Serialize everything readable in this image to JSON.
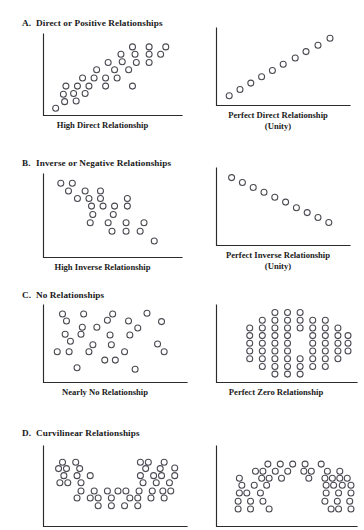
{
  "figure": {
    "title_present": false,
    "marker_style": "open-circle",
    "marker_color": "#4a4a52",
    "axis_color": "#2b2b2b",
    "background": "#ffffff"
  },
  "sections": [
    {
      "letter": "A.",
      "heading": "Direct or Positive Relationships",
      "left_caption": "High Direct Relationship",
      "left_caption_line2": "",
      "right_caption": "Perfect Direct Relationship",
      "right_caption_line2": "(Unity)"
    },
    {
      "letter": "B.",
      "heading": "Inverse or Negative Relationships",
      "left_caption": "High Inverse Relationship",
      "left_caption_line2": "",
      "right_caption": "Perfect Inverse Relationship",
      "right_caption_line2": "(Unity)"
    },
    {
      "letter": "C.",
      "heading": "No Relationships",
      "left_caption": "Nearly No Relationship",
      "left_caption_line2": "",
      "right_caption": "Perfect Zero Relationship",
      "right_caption_line2": ""
    },
    {
      "letter": "D.",
      "heading": "Curvilinear Relationships",
      "left_caption": "",
      "left_caption_line2": "",
      "right_caption": "",
      "right_caption_line2": ""
    }
  ],
  "chart_data": [
    {
      "id": "a-left",
      "type": "scatter",
      "title": "High Direct Relationship",
      "xlabel": "",
      "ylabel": "",
      "xlim": [
        0,
        100
      ],
      "ylim": [
        0,
        100
      ],
      "grid": false,
      "legend": "none",
      "points": [
        [
          6,
          5
        ],
        [
          13,
          14
        ],
        [
          22,
          15
        ],
        [
          12,
          24
        ],
        [
          20,
          25
        ],
        [
          29,
          25
        ],
        [
          14,
          35
        ],
        [
          23,
          35
        ],
        [
          32,
          35
        ],
        [
          45,
          35
        ],
        [
          66,
          35
        ],
        [
          27,
          46
        ],
        [
          36,
          46
        ],
        [
          45,
          46
        ],
        [
          54,
          46
        ],
        [
          38,
          57
        ],
        [
          52,
          57
        ],
        [
          63,
          57
        ],
        [
          47,
          67
        ],
        [
          58,
          68
        ],
        [
          69,
          67
        ],
        [
          79,
          67
        ],
        [
          57,
          78
        ],
        [
          68,
          78
        ],
        [
          79,
          78
        ],
        [
          88,
          78
        ],
        [
          66,
          88
        ],
        [
          79,
          88
        ],
        [
          92,
          88
        ]
      ]
    },
    {
      "id": "a-right",
      "type": "scatter",
      "title": "Perfect Direct Relationship (Unity)",
      "xlabel": "",
      "ylabel": "",
      "xlim": [
        0,
        100
      ],
      "ylim": [
        0,
        100
      ],
      "grid": false,
      "legend": "none",
      "points": [
        [
          6,
          9
        ],
        [
          15,
          18
        ],
        [
          24,
          27
        ],
        [
          33,
          36
        ],
        [
          42,
          45
        ],
        [
          51,
          54
        ],
        [
          61,
          63
        ],
        [
          70,
          72
        ],
        [
          80,
          81
        ],
        [
          90,
          91
        ]
      ]
    },
    {
      "id": "b-left",
      "type": "scatter",
      "title": "High Inverse Relationship",
      "xlabel": "",
      "ylabel": "",
      "xlim": [
        0,
        100
      ],
      "ylim": [
        0,
        100
      ],
      "grid": false,
      "legend": "none",
      "points": [
        [
          10,
          93
        ],
        [
          19,
          93
        ],
        [
          16,
          83
        ],
        [
          29,
          83
        ],
        [
          41,
          83
        ],
        [
          23,
          73
        ],
        [
          32,
          73
        ],
        [
          41,
          73
        ],
        [
          62,
          73
        ],
        [
          34,
          63
        ],
        [
          43,
          63
        ],
        [
          52,
          63
        ],
        [
          62,
          63
        ],
        [
          35,
          52
        ],
        [
          51,
          52
        ],
        [
          33,
          41
        ],
        [
          47,
          41
        ],
        [
          61,
          41
        ],
        [
          75,
          41
        ],
        [
          50,
          30
        ],
        [
          61,
          30
        ],
        [
          72,
          30
        ],
        [
          83,
          17
        ]
      ]
    },
    {
      "id": "b-right",
      "type": "scatter",
      "title": "Perfect Inverse Relationship (Unity)",
      "xlabel": "",
      "ylabel": "",
      "xlim": [
        0,
        100
      ],
      "ylim": [
        0,
        100
      ],
      "grid": false,
      "legend": "none",
      "points": [
        [
          8,
          92
        ],
        [
          17,
          85
        ],
        [
          26,
          78
        ],
        [
          35,
          71
        ],
        [
          44,
          64
        ],
        [
          53,
          57
        ],
        [
          62,
          49
        ],
        [
          71,
          42
        ],
        [
          80,
          35
        ],
        [
          89,
          28
        ]
      ]
    },
    {
      "id": "c-left",
      "type": "scatter",
      "title": "Nearly No Relationship",
      "xlabel": "",
      "ylabel": "",
      "xlim": [
        0,
        100
      ],
      "ylim": [
        0,
        100
      ],
      "grid": false,
      "legend": "none",
      "points": [
        [
          11,
          93
        ],
        [
          27,
          93
        ],
        [
          49,
          93
        ],
        [
          75,
          94
        ],
        [
          14,
          83
        ],
        [
          45,
          84
        ],
        [
          61,
          83
        ],
        [
          86,
          82
        ],
        [
          26,
          74
        ],
        [
          37,
          74
        ],
        [
          68,
          73
        ],
        [
          13,
          64
        ],
        [
          25,
          64
        ],
        [
          47,
          63
        ],
        [
          62,
          63
        ],
        [
          17,
          54
        ],
        [
          34,
          49
        ],
        [
          48,
          49
        ],
        [
          83,
          50
        ],
        [
          7,
          39
        ],
        [
          16,
          39
        ],
        [
          31,
          39
        ],
        [
          58,
          39
        ],
        [
          88,
          39
        ],
        [
          43,
          27
        ],
        [
          51,
          27
        ],
        [
          22,
          16
        ],
        [
          66,
          14
        ]
      ]
    },
    {
      "id": "c-right",
      "type": "scatter",
      "title": "Perfect Zero Relationship",
      "xlabel": "",
      "ylabel": "",
      "xlim": [
        0,
        100
      ],
      "ylim": [
        0,
        100
      ],
      "grid": false,
      "legend": "none",
      "rows": [
        {
          "y": 95,
          "xs": [
            42,
            52,
            62
          ]
        },
        {
          "y": 84,
          "xs": [
            32,
            42,
            52,
            62,
            72,
            82
          ]
        },
        {
          "y": 73,
          "xs": [
            22,
            32,
            42,
            52,
            62,
            72,
            82,
            92
          ]
        },
        {
          "y": 62,
          "xs": [
            22,
            32,
            42,
            52,
            72,
            82,
            92,
            100
          ]
        },
        {
          "y": 51,
          "xs": [
            22,
            32,
            42,
            52,
            72,
            82,
            92,
            100
          ]
        },
        {
          "y": 40,
          "xs": [
            22,
            32,
            42,
            52,
            72,
            82,
            92,
            100
          ]
        },
        {
          "y": 29,
          "xs": [
            22,
            32,
            42,
            52,
            62,
            72,
            82,
            92
          ]
        },
        {
          "y": 18,
          "xs": [
            32,
            42,
            52,
            62,
            72,
            82
          ]
        },
        {
          "y": 7,
          "xs": [
            42,
            52,
            62
          ]
        }
      ]
    },
    {
      "id": "d-left",
      "type": "scatter",
      "title": "Curvilinear (U-shaped)",
      "xlabel": "",
      "ylabel": "",
      "xlim": [
        0,
        100
      ],
      "ylim": [
        0,
        100
      ],
      "grid": false,
      "legend": "none",
      "points": [
        [
          11,
          95
        ],
        [
          21,
          95
        ],
        [
          70,
          95
        ],
        [
          76,
          95
        ],
        [
          88,
          95
        ],
        [
          8,
          85
        ],
        [
          14,
          85
        ],
        [
          24,
          85
        ],
        [
          74,
          85
        ],
        [
          85,
          85
        ],
        [
          96,
          86
        ],
        [
          12,
          74
        ],
        [
          22,
          74
        ],
        [
          32,
          74
        ],
        [
          70,
          74
        ],
        [
          80,
          74
        ],
        [
          86,
          74
        ],
        [
          96,
          74
        ],
        [
          9,
          63
        ],
        [
          15,
          63
        ],
        [
          25,
          63
        ],
        [
          72,
          63
        ],
        [
          82,
          63
        ],
        [
          92,
          63
        ],
        [
          25,
          50
        ],
        [
          35,
          50
        ],
        [
          45,
          50
        ],
        [
          53,
          50
        ],
        [
          59,
          50
        ],
        [
          69,
          50
        ],
        [
          79,
          50
        ],
        [
          87,
          50
        ],
        [
          93,
          50
        ],
        [
          22,
          39
        ],
        [
          32,
          39
        ],
        [
          38,
          39
        ],
        [
          48,
          39
        ],
        [
          62,
          39
        ],
        [
          68,
          39
        ],
        [
          78,
          39
        ],
        [
          88,
          39
        ],
        [
          38,
          27
        ],
        [
          48,
          27
        ],
        [
          58,
          27
        ],
        [
          68,
          27
        ]
      ]
    },
    {
      "id": "d-right",
      "type": "scatter",
      "title": "Curvilinear (inverted-U)",
      "xlabel": "",
      "ylabel": "",
      "xlim": [
        0,
        100
      ],
      "ylim": [
        0,
        100
      ],
      "grid": false,
      "legend": "none",
      "points": [
        [
          37,
          92
        ],
        [
          47,
          92
        ],
        [
          57,
          92
        ],
        [
          67,
          92
        ],
        [
          80,
          92
        ],
        [
          27,
          81
        ],
        [
          33,
          81
        ],
        [
          43,
          81
        ],
        [
          53,
          81
        ],
        [
          66,
          81
        ],
        [
          72,
          81
        ],
        [
          85,
          81
        ],
        [
          95,
          81
        ],
        [
          14,
          70
        ],
        [
          32,
          70
        ],
        [
          38,
          70
        ],
        [
          48,
          70
        ],
        [
          70,
          70
        ],
        [
          83,
          70
        ],
        [
          89,
          70
        ],
        [
          95,
          70
        ],
        [
          101,
          70
        ],
        [
          16,
          59
        ],
        [
          26,
          59
        ],
        [
          36,
          59
        ],
        [
          84,
          59
        ],
        [
          90,
          59
        ],
        [
          97,
          59
        ],
        [
          104,
          59
        ],
        [
          14,
          47
        ],
        [
          20,
          47
        ],
        [
          31,
          47
        ],
        [
          84,
          47
        ],
        [
          94,
          47
        ],
        [
          104,
          47
        ],
        [
          13,
          34
        ],
        [
          23,
          34
        ],
        [
          33,
          34
        ],
        [
          83,
          34
        ],
        [
          93,
          34
        ],
        [
          103,
          34
        ],
        [
          13,
          22
        ],
        [
          23,
          22
        ],
        [
          38,
          22
        ],
        [
          88,
          22
        ],
        [
          94,
          22
        ],
        [
          104,
          22
        ]
      ]
    }
  ]
}
